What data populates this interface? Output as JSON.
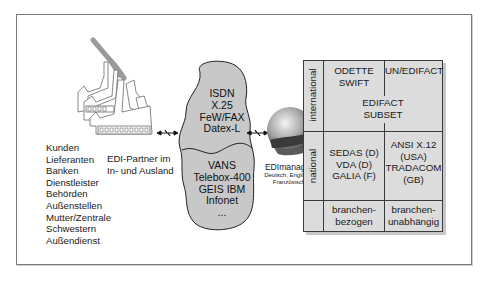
{
  "diagram": {
    "partners": {
      "caption_line1": "EDI-Partner im",
      "caption_line2": "In- und Ausland",
      "list": [
        "Kunden",
        "Lieferanten",
        "Banken",
        "Dienstleister",
        "Behörden",
        "Außenstellen",
        "Mutter/Zentrale",
        "Schwestern",
        "Außendienst"
      ]
    },
    "network_cloud": {
      "top_items": [
        "ISDN",
        "X.25",
        "FeW/FAX",
        "Datex-L"
      ],
      "bottom_items": [
        "VANS",
        "Telebox-400",
        "GEIS IBM",
        "Infonet",
        "..."
      ]
    },
    "globe": {
      "title": "EDImanager",
      "languages_line1": "Deutsch, Englisch,",
      "languages_line2": "Französisch"
    },
    "standards_matrix": {
      "row_labels": {
        "international": "international",
        "national": "national"
      },
      "international_left": [
        "ODETTE",
        "SWIFT"
      ],
      "international_right": [
        "UN/EDIFACT"
      ],
      "international_span": [
        "EDIFACT",
        "SUBSET"
      ],
      "national_left": [
        "SEDAS (D)",
        "VDA (D)",
        "GALIA (F)"
      ],
      "national_right": [
        "ANSI X.12",
        "(USA)",
        "TRADACOM",
        "(GB)"
      ],
      "footer_left": [
        "branchen-",
        "bezogen"
      ],
      "footer_right": [
        "branchen-",
        "unabhängig"
      ]
    },
    "colors": {
      "frame": "#7a7a7a",
      "cloud_fill": "#c8c8c8",
      "matrix_fill": "#dcdcdc",
      "smoke": "#9a9a9a"
    }
  }
}
